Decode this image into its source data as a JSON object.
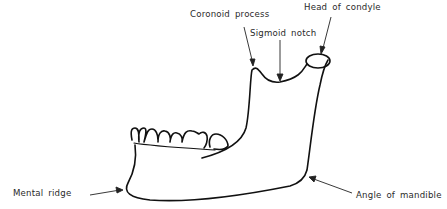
{
  "figure": {
    "labels": {
      "coronoid_process": "Coronoid process",
      "sigmoid_notch": "Sigmoid notch",
      "head_of_condyle": "Head of condyle",
      "mental_ridge": "Mental ridge",
      "angle_of_mandible": "Angle of mandible"
    },
    "caption_fragment": "",
    "colors": {
      "line": "#111111",
      "text": "#2a2a2a",
      "background": "#ffffff"
    }
  }
}
